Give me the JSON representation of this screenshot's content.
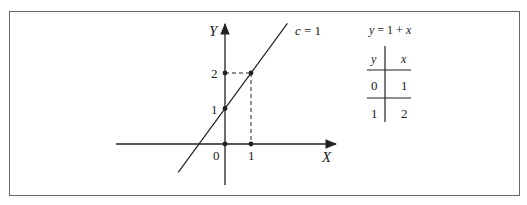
{
  "diagram": {
    "axes": {
      "x_label": "X",
      "y_label": "Y",
      "origin_label": "0"
    },
    "x_ticks": [
      {
        "value": 1,
        "label": "1"
      }
    ],
    "y_ticks": [
      {
        "value": 1,
        "label": "1"
      },
      {
        "value": 2,
        "label": "2"
      }
    ],
    "line": {
      "label": "c = 1",
      "slope": 1,
      "intercept": 1,
      "x_range": [
        -1.8,
        2.4
      ]
    },
    "points": [
      {
        "x": 0,
        "y": 0
      },
      {
        "x": 1,
        "y": 0
      },
      {
        "x": 0,
        "y": 1
      },
      {
        "x": 0,
        "y": 2
      },
      {
        "x": 1,
        "y": 2
      }
    ],
    "guides": [
      {
        "from": [
          0,
          2
        ],
        "to": [
          1,
          2
        ]
      },
      {
        "from": [
          1,
          2
        ],
        "to": [
          1,
          0
        ]
      }
    ],
    "colors": {
      "ink": "#222222",
      "frame": "#666666"
    }
  },
  "table": {
    "equation": "y = 1 + x",
    "headers": [
      "y",
      "x"
    ],
    "rows": [
      [
        "0",
        "1"
      ],
      [
        "1",
        "2"
      ]
    ]
  }
}
